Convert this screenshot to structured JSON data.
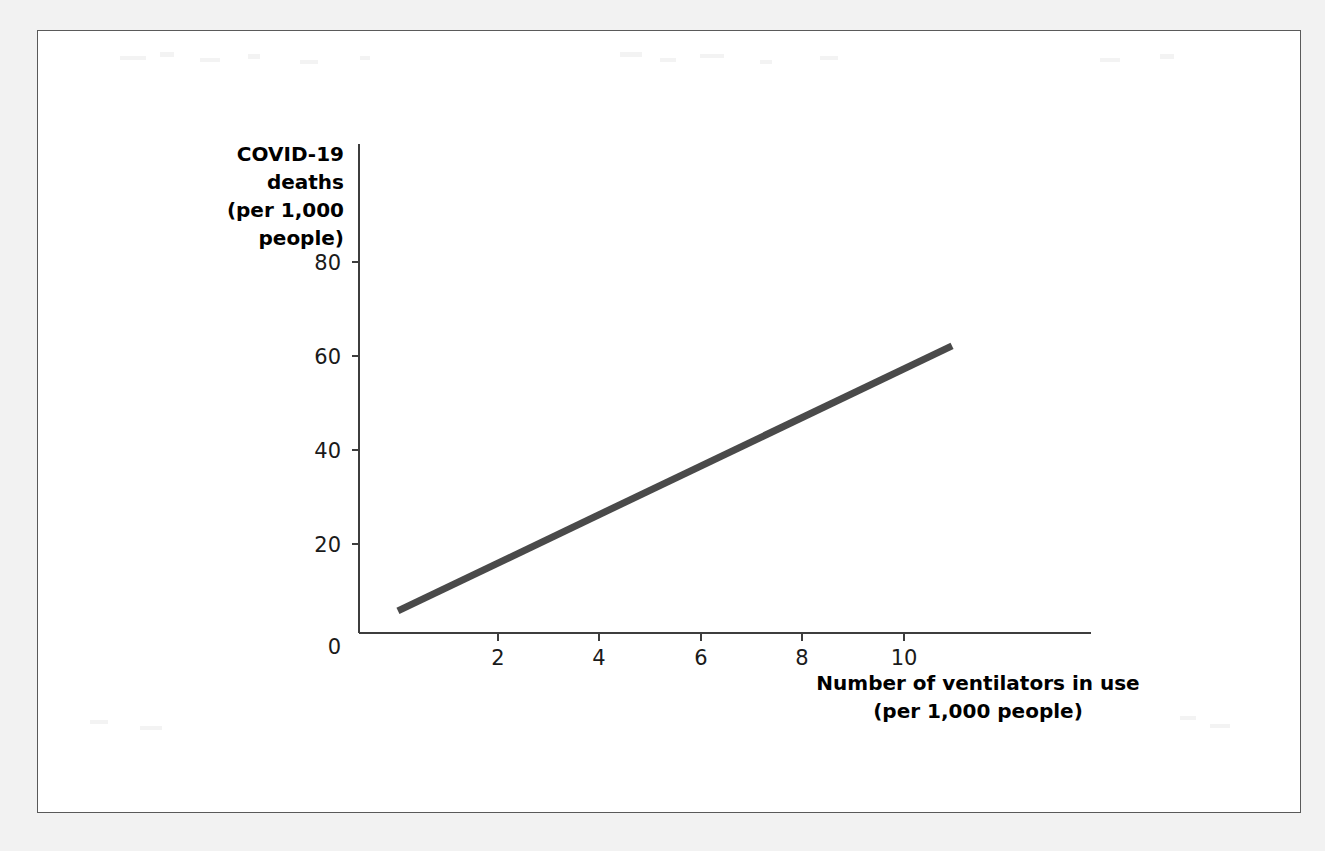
{
  "figure": {
    "frame_border_color": "#5a5a5a",
    "page_background": "#f2f2f2",
    "panel_background": "#ffffff"
  },
  "chart_data": {
    "type": "line",
    "title": "",
    "xlabel_line1": "Number of ventilators in use",
    "xlabel_line2": "(per 1,000 people)",
    "ylabel_line1": "COVID-19",
    "ylabel_line2": "deaths",
    "ylabel_line3": "(per 1,000",
    "ylabel_line4": "people)",
    "xlim": [
      0,
      14.5
    ],
    "ylim": [
      0,
      89
    ],
    "xticks": [
      0,
      2,
      4,
      6,
      8,
      10
    ],
    "xtick_labels": [
      "0",
      "2",
      "4",
      "6",
      "8",
      "10"
    ],
    "yticks": [
      0,
      20,
      40,
      60,
      80
    ],
    "ytick_labels": [
      "0",
      "20",
      "40",
      "60",
      "80"
    ],
    "grid": false,
    "legend": "none",
    "series": [
      {
        "name": "COVID-19 deaths vs ventilators in use",
        "color": "#4a4a4a",
        "line_width": 7,
        "x": [
          0.77,
          11.72
        ],
        "y": [
          4.7,
          61.1
        ]
      }
    ],
    "annotations": []
  }
}
